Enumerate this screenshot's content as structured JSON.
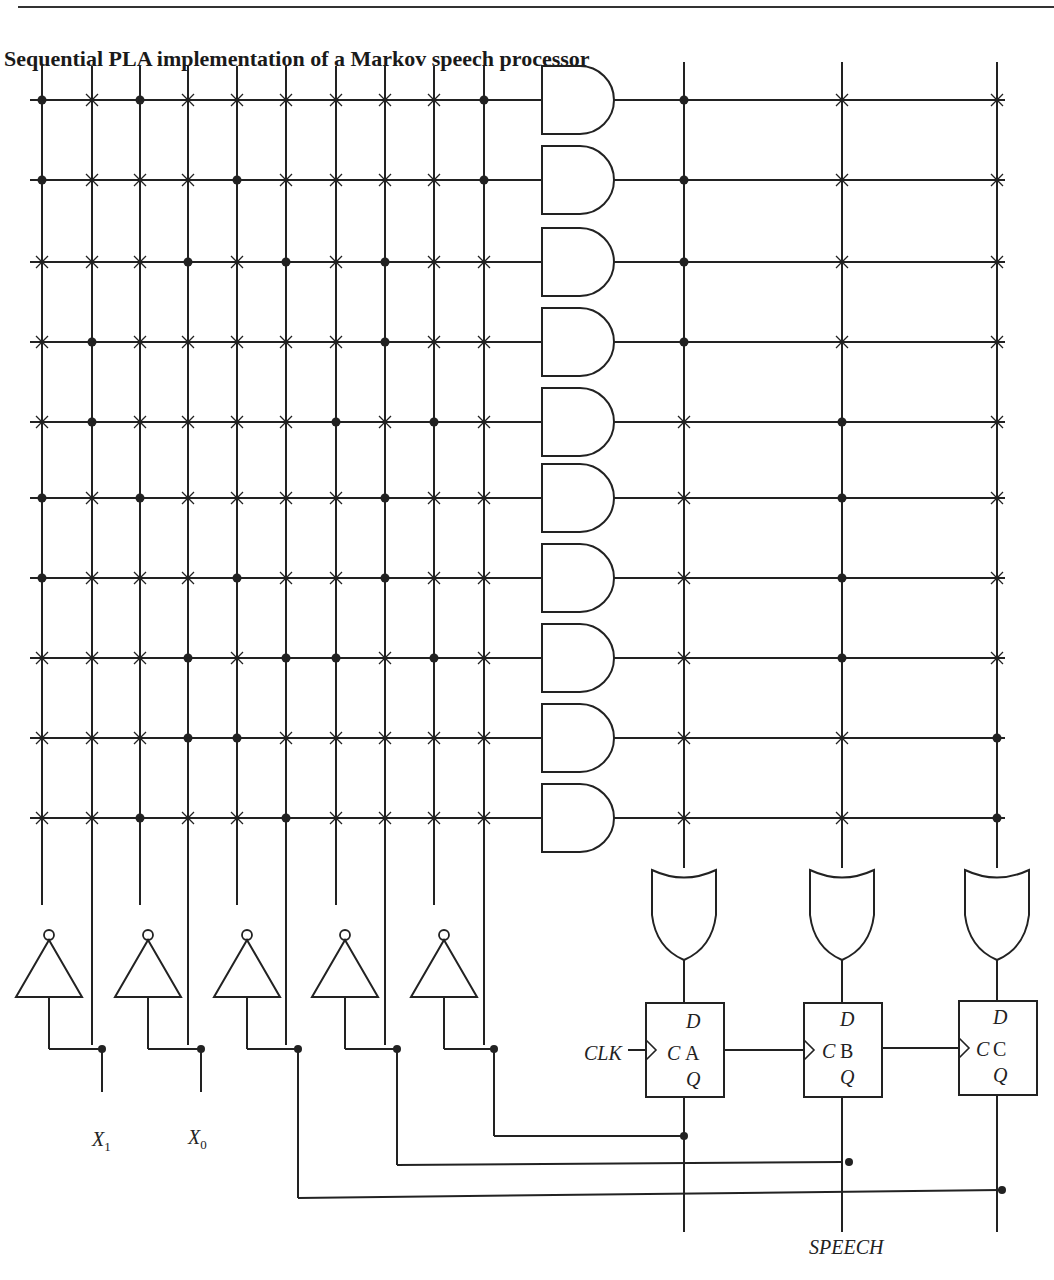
{
  "figure": {
    "title": "Sequential PLA implementation of a Markov speech processor"
  },
  "inputs": {
    "x1_label": "X",
    "x1_sub": "1",
    "x0_label": "X",
    "x0_sub": "0"
  },
  "clock": {
    "label": "CLK"
  },
  "output": {
    "label": "SPEECH"
  },
  "flipflops": [
    {
      "name": "A",
      "d_label": "D",
      "c_label": "C",
      "q_label": "Q"
    },
    {
      "name": "B",
      "d_label": "D",
      "c_label": "C",
      "q_label": "Q"
    },
    {
      "name": "C",
      "d_label": "D",
      "c_label": "C",
      "q_label": "Q"
    }
  ],
  "and_plane": {
    "columns": 10,
    "rows": [
      {
        "connections": [
          1,
          3,
          10
        ]
      },
      {
        "connections": [
          1,
          5,
          10
        ]
      },
      {
        "connections": [
          4,
          6,
          8
        ]
      },
      {
        "connections": [
          2,
          8
        ]
      },
      {
        "connections": [
          2,
          7,
          9
        ]
      },
      {
        "connections": [
          1,
          3,
          8
        ]
      },
      {
        "connections": [
          1,
          5,
          8
        ]
      },
      {
        "connections": [
          4,
          6,
          7,
          9
        ]
      },
      {
        "connections": [
          4,
          5
        ]
      },
      {
        "connections": [
          3,
          6
        ]
      }
    ]
  },
  "or_plane": {
    "columns": [
      "A",
      "B",
      "C"
    ],
    "rows": [
      {
        "connections": [
          "A"
        ]
      },
      {
        "connections": [
          "A"
        ]
      },
      {
        "connections": [
          "A"
        ]
      },
      {
        "connections": [
          "A"
        ]
      },
      {
        "connections": [
          "B"
        ]
      },
      {
        "connections": [
          "B"
        ]
      },
      {
        "connections": [
          "B"
        ]
      },
      {
        "connections": [
          "B"
        ]
      },
      {
        "connections": [
          "C"
        ]
      },
      {
        "connections": [
          "C"
        ]
      }
    ]
  },
  "colors": {
    "line": "#222222",
    "background": "#ffffff"
  }
}
